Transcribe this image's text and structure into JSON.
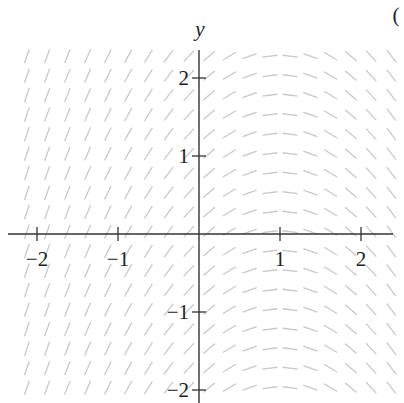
{
  "chart_data": {
    "type": "slope-field",
    "title": "",
    "xlabel": "",
    "ylabel": "y",
    "corner_label": "(",
    "xlim": [
      -2.4,
      2.4
    ],
    "ylim": [
      -2.1,
      2.4
    ],
    "x_ticks": [
      -2,
      -1,
      1,
      2
    ],
    "x_tick_labels": [
      "−2",
      "−1",
      "1",
      "2"
    ],
    "y_ticks": [
      -2,
      -1,
      1,
      2
    ],
    "y_tick_labels": [
      "−2",
      "−1",
      "1",
      "2"
    ],
    "slope_function": "dy/dx = 1 - x",
    "grid_step_x": 0.25,
    "grid_step_y": 0.25,
    "segment_color": "#c8c8c8",
    "axis_color": "#333333",
    "grid": false,
    "legend": false
  }
}
